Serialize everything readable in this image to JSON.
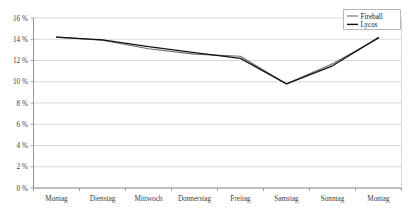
{
  "chart_data": {
    "type": "line",
    "title": "",
    "xlabel": "",
    "ylabel": "",
    "categories": [
      "Montag",
      "Dienstag",
      "Mittwoch",
      "Donnerstag",
      "Freitag",
      "Samstag",
      "Sonntag",
      "Montag"
    ],
    "ylim": [
      0,
      16
    ],
    "ytick_values": [
      0,
      2,
      4,
      6,
      8,
      10,
      12,
      14,
      16
    ],
    "ytick_labels": [
      "0 %",
      "2 %",
      "4 %",
      "6 %",
      "8 %",
      "10 %",
      "12 %",
      "14 %",
      "16 %"
    ],
    "grid": true,
    "legend_position": "top-right",
    "series": [
      {
        "name": "Fireball",
        "color": "#6e6e6e",
        "values": [
          14.2,
          13.9,
          13.1,
          12.6,
          12.4,
          9.8,
          11.7,
          14.1
        ]
      },
      {
        "name": "Lycos",
        "color": "#111111",
        "values": [
          14.2,
          13.95,
          13.3,
          12.75,
          12.2,
          9.8,
          11.5,
          14.15
        ]
      }
    ]
  },
  "legend": {
    "entries": [
      {
        "label": "Fireball",
        "color": "#6e6e6e"
      },
      {
        "label": "Lycos",
        "color": "#111111"
      }
    ]
  }
}
